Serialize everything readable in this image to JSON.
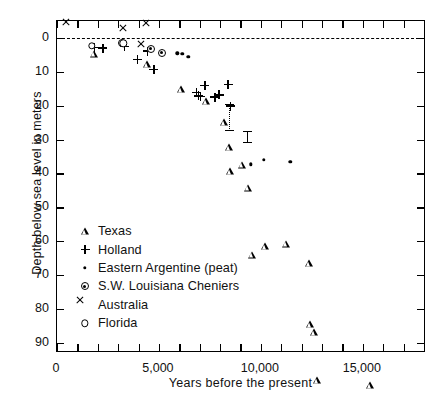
{
  "chart_data": {
    "type": "scatter",
    "title": "",
    "xlabel": "Years before the present",
    "ylabel": "Depth below sea level in meters",
    "xlim": [
      0,
      18100
    ],
    "ylim": [
      -5,
      93
    ],
    "y_inverted": true,
    "grid": false,
    "legend_position": "lower-left-inside",
    "x_ticks": [
      0,
      1000,
      2000,
      3000,
      4000,
      5000,
      6000,
      7000,
      8000,
      9000,
      10000,
      11000,
      12000,
      13000,
      14000,
      15000,
      16000,
      17000,
      18000
    ],
    "x_tick_labels": [
      "0",
      "",
      "",
      "",
      "",
      "5,000",
      "",
      "",
      "",
      "",
      "10,000",
      "",
      "",
      "",
      "",
      "15,000",
      "",
      "",
      ""
    ],
    "y_ticks": [
      0,
      10,
      20,
      30,
      40,
      50,
      60,
      70,
      80,
      90
    ],
    "y_tick_labels": [
      "0",
      "10",
      "20",
      "30",
      "40",
      "50",
      "60",
      "70",
      "80",
      "90"
    ],
    "annotations": [
      {
        "name": "sea-level-datum",
        "type": "hline",
        "y": 0,
        "style": "dashed",
        "label": ""
      }
    ],
    "series": [
      {
        "name": "Texas",
        "marker": "open-triangle",
        "points": [
          {
            "x": 1800,
            "y": 4.6
          },
          {
            "x": 4400,
            "y": 5.7
          },
          {
            "x": 6100,
            "y": 11.0
          },
          {
            "x": 7300,
            "y": 12.5
          },
          {
            "x": 8200,
            "y": 16.5
          },
          {
            "x": 8450,
            "y": 22.0
          },
          {
            "x": 8500,
            "y": 26.9
          },
          {
            "x": 9050,
            "y": 22.9
          },
          {
            "x": 9350,
            "y": 27.7
          },
          {
            "x": 9550,
            "y": 45.4
          },
          {
            "x": 10200,
            "y": 40.9
          },
          {
            "x": 11250,
            "y": 38.0
          },
          {
            "x": 12350,
            "y": 41.6
          },
          {
            "x": 12400,
            "y": 57.7
          },
          {
            "x": 12600,
            "y": 57.9
          },
          {
            "x": 12750,
            "y": 70.0
          },
          {
            "x": 15350,
            "y": 69.5
          },
          {
            "x": 16950,
            "y": 87.3
          }
        ]
      },
      {
        "name": "Holland",
        "marker": "plus",
        "points": [
          {
            "x": 1850,
            "y": 2.8
          },
          {
            "x": 2250,
            "y": 3.0
          },
          {
            "x": 3300,
            "y": 2.5
          },
          {
            "x": 3950,
            "y": 6.3
          },
          {
            "x": 4450,
            "y": 3.9
          },
          {
            "x": 4750,
            "y": 9.3
          },
          {
            "x": 6850,
            "y": 16.1
          },
          {
            "x": 6950,
            "y": 17.1
          },
          {
            "x": 7050,
            "y": 17.3
          },
          {
            "x": 7250,
            "y": 14.0
          },
          {
            "x": 7750,
            "y": 17.5
          },
          {
            "x": 7950,
            "y": 16.8
          },
          {
            "x": 8400,
            "y": 13.7
          },
          {
            "x": 8500,
            "y": 20.1
          }
        ]
      },
      {
        "name": "Eastern Argentine (peat)",
        "marker": "dot",
        "points": [
          {
            "x": 5900,
            "y": 4.5
          },
          {
            "x": 6150,
            "y": 4.7
          },
          {
            "x": 6450,
            "y": 5.5
          },
          {
            "x": 9500,
            "y": 37.3
          },
          {
            "x": 10150,
            "y": 36.0
          },
          {
            "x": 11450,
            "y": 36.6
          }
        ]
      },
      {
        "name": "S.W. Louisiana Cheniers",
        "marker": "circled-dot",
        "points": [
          {
            "x": 3200,
            "y": 1.5
          },
          {
            "x": 4600,
            "y": 3.2
          },
          {
            "x": 5150,
            "y": 4.3
          }
        ]
      },
      {
        "name": "Australia",
        "marker": "x",
        "points": [
          {
            "x": 700,
            "y": -3.3
          },
          {
            "x": 3500,
            "y": -1.5
          },
          {
            "x": 4600,
            "y": -3.0
          },
          {
            "x": 4350,
            "y": 3.3
          }
        ]
      },
      {
        "name": "Florida",
        "marker": "open-circle",
        "points": [
          {
            "x": 1700,
            "y": 2.4
          },
          {
            "x": 3250,
            "y": 1.6
          }
        ]
      }
    ],
    "error_bars": [
      {
        "x": 8450,
        "y_top": 19.5,
        "y_bottom": 27.5,
        "style": "dotted"
      },
      {
        "x": 9350,
        "y_top": 27.5,
        "y_bottom": 31.0,
        "style": "solid"
      }
    ]
  },
  "axes": {
    "x_title": "Years before the present",
    "y_title": "Depth below sea level in meters"
  },
  "legend": {
    "entries": [
      {
        "label": "Texas",
        "marker": "open-triangle"
      },
      {
        "label": "Holland",
        "marker": "plus"
      },
      {
        "label": "Eastern Argentine (peat)",
        "marker": "dot"
      },
      {
        "label": "S.W. Louisiana Cheniers",
        "marker": "circled-dot"
      },
      {
        "label": "Australia",
        "marker": "x"
      },
      {
        "label": "Florida",
        "marker": "open-circle"
      }
    ]
  }
}
